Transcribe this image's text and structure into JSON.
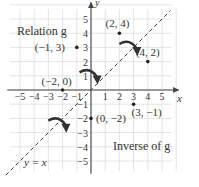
{
  "chart_data": {
    "type": "scatter",
    "title": "",
    "xlabel": "x",
    "ylabel": "y",
    "xlim": [
      -5,
      5
    ],
    "ylim": [
      -5,
      5
    ],
    "grid": true,
    "x_ticks": [
      "-5",
      "-4",
      "-3",
      "-2",
      "-1",
      "1",
      "2",
      "3",
      "4",
      "5"
    ],
    "y_ticks": [
      "5",
      "4",
      "3",
      "2",
      "1",
      "-1",
      "-2",
      "-3",
      "-4",
      "-5"
    ],
    "series": [
      {
        "name": "Relation g",
        "points": [
          {
            "x": -1,
            "y": 3,
            "label": "(−1, 3)"
          },
          {
            "x": -2,
            "y": 0,
            "label": "(−2, 0)"
          },
          {
            "x": 2,
            "y": 4,
            "label": "(2, 4)"
          }
        ]
      },
      {
        "name": "Inverse of g",
        "points": [
          {
            "x": 3,
            "y": -1,
            "label": "(3, −1)"
          },
          {
            "x": 0,
            "y": -2,
            "label": "(0, −2)"
          },
          {
            "x": 4,
            "y": 2,
            "label": "(4, 2)"
          }
        ]
      }
    ],
    "reference_line": {
      "label": "y = x",
      "style": "dashed"
    },
    "annotations": [
      "Relation g",
      "Inverse of g",
      "y = x"
    ]
  }
}
